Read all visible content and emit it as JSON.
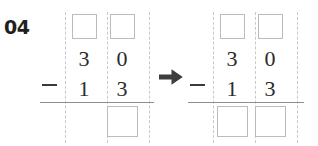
{
  "worksheet": {
    "problem_number": "04",
    "transition_icon": "right-arrow-icon",
    "colors": {
      "ink": "#2b2b2b",
      "number_label": "#231f20",
      "box_border": "#bcbcbc",
      "guide_line": "#c9c9c9",
      "rule_line": "#8d8d8d",
      "arrow": "#3d3d3d",
      "background": "#ffffff"
    }
  },
  "problems": [
    {
      "id": "left-subtraction",
      "operator": "−",
      "columns": [
        "tens",
        "ones"
      ],
      "carry_row": {
        "tens": "",
        "ones": ""
      },
      "minuend": {
        "tens": "3",
        "ones": "0"
      },
      "subtrahend": {
        "tens": "1",
        "ones": "3"
      },
      "answer_row": {
        "tens": null,
        "ones": ""
      },
      "answer_boxes": [
        "ones"
      ]
    },
    {
      "id": "right-subtraction",
      "operator": "−",
      "columns": [
        "tens",
        "ones"
      ],
      "carry_row": {
        "tens": "",
        "ones": ""
      },
      "minuend": {
        "tens": "3",
        "ones": "0"
      },
      "subtrahend": {
        "tens": "1",
        "ones": "3"
      },
      "answer_row": {
        "tens": "",
        "ones": ""
      },
      "answer_boxes": [
        "tens",
        "ones"
      ]
    }
  ]
}
